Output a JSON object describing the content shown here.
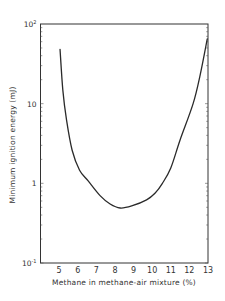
{
  "chart_data": {
    "type": "line",
    "title": "",
    "xlabel": "Methane in methane-air mixture (%)",
    "ylabel": "Minimum ignition energy (mJ)",
    "xlim": [
      4,
      13
    ],
    "ylim": [
      0.1,
      100
    ],
    "yscale": "log",
    "grid": false,
    "legend": null,
    "x_ticks": [
      5,
      6,
      7,
      8,
      9,
      10,
      11,
      12,
      13
    ],
    "y_ticks": [
      {
        "value": 0.1,
        "label": "10",
        "exp": "-1"
      },
      {
        "value": 1,
        "label": "1",
        "exp": ""
      },
      {
        "value": 10,
        "label": "10",
        "exp": ""
      },
      {
        "value": 100,
        "label": "10",
        "exp": "2"
      }
    ],
    "series": [
      {
        "name": "Minimum ignition energy",
        "x": [
          5.05,
          5.2,
          5.4,
          5.7,
          6.1,
          6.55,
          7.2,
          7.74,
          8.28,
          8.9,
          9.7,
          10.15,
          10.55,
          11.0,
          11.5,
          12.2,
          12.58,
          12.96
        ],
        "y": [
          48,
          14.8,
          6.2,
          2.6,
          1.46,
          1.08,
          0.7,
          0.55,
          0.49,
          0.52,
          0.62,
          0.75,
          1.0,
          1.56,
          3.5,
          10,
          23,
          65
        ]
      }
    ],
    "annotations": [],
    "colors": {
      "line": "#2a2a2a",
      "axis": "#333333"
    }
  }
}
